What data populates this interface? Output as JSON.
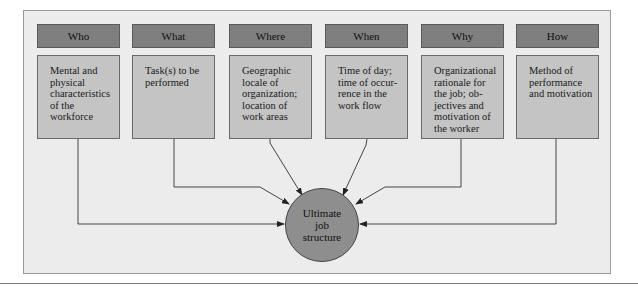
{
  "diagram": {
    "columns": [
      {
        "header": "Who",
        "description": "Mental and physical characteristics of the workforce"
      },
      {
        "header": "What",
        "description": "Task(s) to be performed"
      },
      {
        "header": "Where",
        "description": "Geographic locale of organization; location of work areas"
      },
      {
        "header": "When",
        "description": "Time of day; time of occur-rence in the work flow"
      },
      {
        "header": "Why",
        "description": "Organizational rationale for the job; ob-jectives and motivation of the worker"
      },
      {
        "header": "How",
        "description": "Method of performance and motivation"
      }
    ],
    "center": {
      "label": "Ultimate job structure"
    },
    "colors": {
      "header": "#7f7f7f",
      "box": "#c4c4c4",
      "circle": "#8e8e8e",
      "background": "#ececec"
    }
  }
}
